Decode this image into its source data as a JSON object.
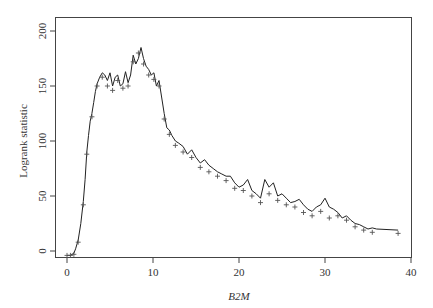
{
  "chart_data": {
    "type": "line",
    "title": "",
    "xlabel": "B2M",
    "ylabel": "Logrank statistic",
    "xlim": [
      -1.5,
      40
    ],
    "ylim": [
      -6,
      205
    ],
    "xticks": [
      0,
      10,
      20,
      30,
      40
    ],
    "yticks": [
      0,
      50,
      100,
      150,
      200
    ],
    "grid": false,
    "legend": null,
    "series": [
      {
        "name": "logrank-line",
        "style": "solid",
        "x": [
          0,
          0.4,
          0.8,
          1.0,
          1.3,
          1.6,
          1.9,
          2.1,
          2.3,
          2.5,
          2.7,
          2.9,
          3.1,
          3.3,
          3.5,
          3.8,
          4.1,
          4.4,
          4.7,
          5.0,
          5.3,
          5.6,
          5.9,
          6.2,
          6.5,
          6.8,
          7.1,
          7.4,
          7.7,
          8.0,
          8.3,
          8.6,
          8.9,
          9.2,
          9.5,
          9.8,
          10.1,
          10.4,
          10.7,
          11.0,
          11.3,
          11.6,
          11.9,
          12.2,
          12.6,
          13.0,
          13.5,
          14.0,
          14.5,
          15.0,
          15.5,
          16.0,
          16.5,
          17.0,
          17.5,
          18.0,
          18.5,
          19.0,
          19.5,
          20.0,
          20.5,
          21.0,
          21.5,
          22.0,
          22.5,
          23.0,
          23.5,
          24.0,
          24.5,
          25.0,
          25.5,
          26.0,
          26.5,
          27.0,
          27.5,
          28.0,
          28.5,
          29.0,
          29.5,
          30.0,
          30.5,
          31.0,
          31.5,
          32.0,
          32.5,
          33.0,
          33.5,
          34.0,
          34.5,
          35.0,
          35.5,
          36.0,
          38.5
        ],
        "y": [
          -4,
          -4,
          -2,
          2,
          10,
          25,
          45,
          65,
          90,
          105,
          118,
          125,
          135,
          145,
          152,
          158,
          162,
          160,
          155,
          162,
          150,
          158,
          160,
          150,
          152,
          163,
          153,
          160,
          178,
          170,
          175,
          185,
          175,
          168,
          165,
          160,
          162,
          150,
          155,
          140,
          125,
          112,
          110,
          105,
          100,
          98,
          95,
          88,
          92,
          85,
          80,
          83,
          78,
          75,
          72,
          70,
          68,
          68,
          62,
          58,
          60,
          65,
          55,
          52,
          48,
          65,
          58,
          62,
          50,
          52,
          48,
          44,
          45,
          47,
          42,
          38,
          36,
          40,
          42,
          48,
          40,
          38,
          35,
          30,
          32,
          28,
          25,
          24,
          22,
          20,
          21,
          20,
          19
        ]
      },
      {
        "name": "censored-markers",
        "style": "marker-plus",
        "x": [
          0,
          0.4,
          0.8,
          1.3,
          1.9,
          2.3,
          2.9,
          3.5,
          4.1,
          4.7,
          5.3,
          5.9,
          6.5,
          7.1,
          7.7,
          8.3,
          8.9,
          9.5,
          10.1,
          10.7,
          11.3,
          11.9,
          12.6,
          13.5,
          14.5,
          15.5,
          16.5,
          17.5,
          18.5,
          19.5,
          20.5,
          21.5,
          22.5,
          23.5,
          24.5,
          25.5,
          26.5,
          27.5,
          28.5,
          29.5,
          30.5,
          31.5,
          32.5,
          33.5,
          34.5,
          35.5,
          38.5
        ],
        "y": [
          -4,
          -4,
          -3,
          8,
          42,
          88,
          122,
          150,
          158,
          150,
          146,
          155,
          148,
          150,
          172,
          180,
          170,
          160,
          156,
          150,
          120,
          106,
          96,
          90,
          85,
          76,
          72,
          68,
          64,
          57,
          55,
          50,
          44,
          52,
          46,
          42,
          40,
          35,
          32,
          36,
          30,
          32,
          28,
          22,
          19,
          17,
          16
        ]
      }
    ]
  }
}
